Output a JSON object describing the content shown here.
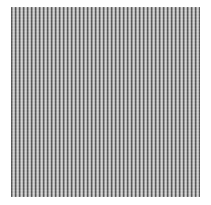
{
  "image": {
    "subject": "vertical striped gray texture swatch",
    "background_color": "#ffffff",
    "stripe_colors": [
      "#5a5a5a",
      "#9a9a9a",
      "#d6d6d6",
      "#bcbcbc"
    ],
    "stripe_orientation": "vertical"
  }
}
